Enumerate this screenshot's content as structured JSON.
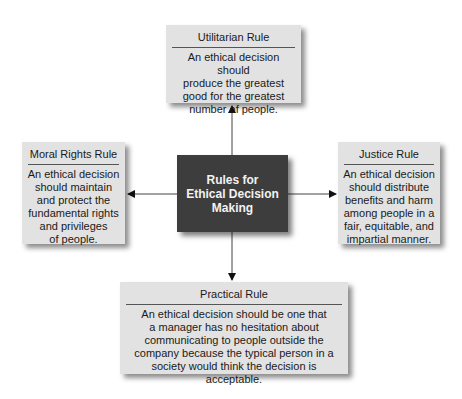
{
  "diagram": {
    "center": {
      "line1": "Rules for",
      "line2": "Ethical Decision",
      "line3": "Making"
    },
    "top": {
      "title": "Utilitarian Rule",
      "lines": [
        "An ethical decision should",
        "produce the greatest",
        "good for the greatest",
        "number of people."
      ]
    },
    "left": {
      "title": "Moral Rights Rule",
      "lines": [
        "An ethical decision",
        "should maintain",
        "and protect the",
        "fundamental rights",
        "and privileges",
        "of people."
      ]
    },
    "right": {
      "title": "Justice Rule",
      "lines": [
        "An ethical decision",
        "should distribute",
        "benefits and harm",
        "among people in a",
        "fair, equitable, and",
        "impartial manner."
      ]
    },
    "bottom": {
      "title": "Practical Rule",
      "lines": [
        "An ethical decision should be one that",
        "a manager has no hesitation about",
        "communicating to people outside the",
        "company because the typical person in a",
        "society would think the decision is acceptable."
      ]
    }
  }
}
